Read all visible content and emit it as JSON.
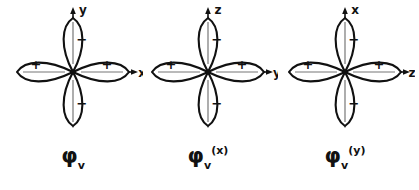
{
  "figure": {
    "background_color": "#ffffff",
    "ink_color": "#111111",
    "axis_line_color": "#888888",
    "panel_count": 3
  },
  "panels": [
    {
      "id": "panel-0",
      "name": "phi-v",
      "vertical_axis_label": "y",
      "horizontal_axis_label": "x",
      "lobes": [
        {
          "position": "left",
          "sign": "+"
        },
        {
          "position": "right",
          "sign": "+"
        },
        {
          "position": "top",
          "sign": "−"
        },
        {
          "position": "bottom",
          "sign": "−"
        }
      ],
      "caption": {
        "symbol": "φ",
        "subscript": "v",
        "superscript": ""
      }
    },
    {
      "id": "panel-1",
      "name": "phi-v-x",
      "vertical_axis_label": "z",
      "horizontal_axis_label": "y",
      "lobes": [
        {
          "position": "left",
          "sign": "+"
        },
        {
          "position": "right",
          "sign": "+"
        },
        {
          "position": "top",
          "sign": "−"
        },
        {
          "position": "bottom",
          "sign": "−"
        }
      ],
      "caption": {
        "symbol": "φ",
        "subscript": "v",
        "superscript": "(x)"
      }
    },
    {
      "id": "panel-2",
      "name": "phi-v-y",
      "vertical_axis_label": "x",
      "horizontal_axis_label": "z",
      "lobes": [
        {
          "position": "left",
          "sign": "+"
        },
        {
          "position": "right",
          "sign": "+"
        },
        {
          "position": "top",
          "sign": "−"
        },
        {
          "position": "bottom",
          "sign": "−"
        }
      ],
      "caption": {
        "symbol": "φ",
        "subscript": "v",
        "superscript": "(y)"
      }
    }
  ]
}
